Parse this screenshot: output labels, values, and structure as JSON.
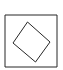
{
  "figure": {
    "panel_label": "A",
    "background_color": "#ffffff",
    "stroke_color": "#262626",
    "stroke_width": 1,
    "canvas": {
      "width": 63,
      "height": 70
    }
  },
  "chart_data": {
    "type": "diagram",
    "title": "A",
    "subtitle": "",
    "xlabel": "",
    "ylabel": "",
    "grid": false,
    "legend": false,
    "shapes": [
      {
        "name": "outer-square",
        "kind": "rect",
        "fill": "none",
        "stroke": "#262626",
        "stroke_width": 1,
        "x": 5,
        "y": 15,
        "width": 52,
        "height": 52,
        "rotation_deg": 0,
        "points": [
          [
            5,
            15
          ],
          [
            57,
            15
          ],
          [
            57,
            67
          ],
          [
            5,
            67
          ]
        ]
      },
      {
        "name": "inner-rotated-square",
        "kind": "polygon",
        "fill": "none",
        "stroke": "#262626",
        "stroke_width": 1,
        "rotation_deg": 22,
        "side_length": 30,
        "center": [
          31.5,
          42.2
        ],
        "points": [
          [
            27.5,
            22.0
          ],
          [
            50.0,
            42.0
          ],
          [
            35.5,
            62.0
          ],
          [
            13.0,
            43.0
          ]
        ]
      }
    ],
    "annotations": [
      {
        "name": "panel-label",
        "text": "A",
        "x": 4,
        "y": 10,
        "font_style": "serif",
        "font_size": 11,
        "color": "#1a1a1a"
      }
    ]
  }
}
